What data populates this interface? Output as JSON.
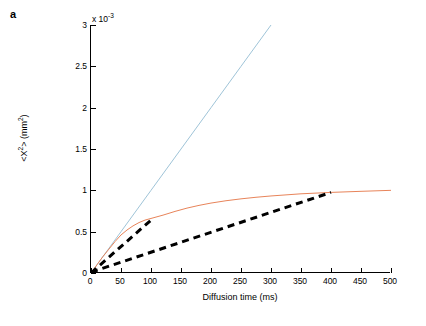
{
  "figure": {
    "panel_label": "a",
    "exponent_label": "x 10",
    "exponent_power": "-3",
    "colors": {
      "free_diffusion": "#9fc4d8",
      "restricted": "#e8845a",
      "tangent": "#000000",
      "axis": "#000000",
      "background": "#ffffff"
    }
  },
  "chart_data": {
    "type": "line",
    "title": "",
    "xlabel": "Diffusion time (ms)",
    "ylabel": "<X²> (mm²)",
    "y_axis_multiplier": "x 10^-3",
    "xlim": [
      0,
      500
    ],
    "ylim": [
      0,
      3
    ],
    "xticks": [
      0,
      50,
      100,
      150,
      200,
      250,
      300,
      350,
      400,
      450,
      500
    ],
    "xtick_labels": [
      "0",
      "50",
      "100",
      "150",
      "200",
      "250",
      "300",
      "350",
      "400",
      "450",
      "500"
    ],
    "yticks": [
      0,
      0.5,
      1,
      1.5,
      2,
      2.5,
      3
    ],
    "ytick_labels": [
      "0",
      "0.5",
      "1",
      "1.5",
      "2",
      "2.5",
      "3"
    ],
    "grid": false,
    "legend": "none",
    "series": [
      {
        "name": "free diffusion",
        "style": "solid",
        "color": "#9fc4d8",
        "x": [
          0,
          50,
          100,
          150,
          200,
          250,
          300
        ],
        "y": [
          0,
          0.5,
          1.0,
          1.5,
          2.0,
          2.5,
          3.0
        ]
      },
      {
        "name": "restricted diffusion",
        "style": "solid",
        "color": "#e8845a",
        "x": [
          0,
          10,
          20,
          30,
          40,
          50,
          60,
          70,
          80,
          90,
          100,
          110,
          120,
          140,
          160,
          180,
          200,
          225,
          250,
          275,
          300,
          350,
          400,
          450,
          500
        ],
        "y": [
          0,
          0.1,
          0.2,
          0.29,
          0.38,
          0.46,
          0.52,
          0.57,
          0.61,
          0.64,
          0.66,
          0.68,
          0.7,
          0.745,
          0.785,
          0.818,
          0.846,
          0.874,
          0.897,
          0.916,
          0.932,
          0.958,
          0.975,
          0.988,
          1.0
        ]
      },
      {
        "name": "short-time tangent",
        "style": "dashed",
        "color": "#000000",
        "x": [
          0,
          105
        ],
        "y": [
          0,
          0.672
        ]
      },
      {
        "name": "long-time tangent",
        "style": "dashed",
        "color": "#000000",
        "x": [
          0,
          400
        ],
        "y": [
          0.01,
          0.975
        ]
      }
    ]
  }
}
